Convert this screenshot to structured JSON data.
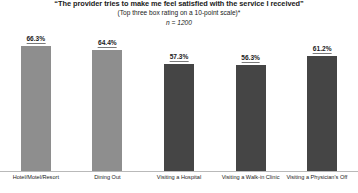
{
  "chart_data": {
    "type": "bar",
    "title": "“The provider tries to make me feel satisfied with the service I received”",
    "subtitle": "(Top three box rating on a 10-point scale)*",
    "sample_size_label": "n = 1200",
    "categories": [
      "Hotel/Motel/Resort",
      "Dining Out",
      "Visiting a Hospital",
      "Visiting a Walk-in Clinic",
      "Visiting a Physician's Off"
    ],
    "values": [
      66.3,
      64.4,
      57.3,
      56.3,
      61.2
    ],
    "value_labels": [
      "66.3%",
      "64.4%",
      "57.3%",
      "56.3%",
      "61.2%"
    ],
    "bar_colors": [
      "#8e8e8e",
      "#8e8e8e",
      "#454545",
      "#454545",
      "#454545"
    ],
    "xlabel": "",
    "ylabel": "",
    "ylim": [
      0,
      75
    ],
    "grid": false,
    "legend": "none",
    "axis_color": "#b9b9b9"
  },
  "clipped_footer": " "
}
